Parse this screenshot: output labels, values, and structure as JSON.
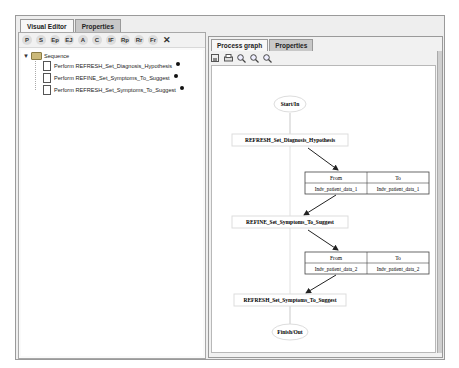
{
  "left_panel": {
    "tabs": [
      "Visual Editor",
      "Properties"
    ],
    "toolbar": [
      {
        "icon": "P",
        "name": "perform-icon"
      },
      {
        "icon": "S",
        "name": "sequence-icon"
      },
      {
        "icon": "Ep",
        "name": "ep-icon"
      },
      {
        "icon": "EJ",
        "name": "ej-icon"
      },
      {
        "icon": "A",
        "name": "a-icon"
      },
      {
        "icon": "C",
        "name": "c-icon"
      },
      {
        "icon": "IF",
        "name": "if-icon"
      },
      {
        "icon": "Rp",
        "name": "rp-icon"
      },
      {
        "icon": "Rr",
        "name": "rr-icon"
      },
      {
        "icon": "Fr",
        "name": "fr-icon"
      },
      {
        "icon": "✕",
        "name": "delete-icon"
      }
    ],
    "tree": {
      "root": "Sequence",
      "items": [
        "Perform REFRESH_Set_Diagnosis_Hypothesis",
        "Perform REFINE_Set_Symptoms_To_Suggest",
        "Perform REFRESH_Set_Symptoms_To_Suggest"
      ]
    }
  },
  "right_panel": {
    "tabs": [
      "Process graph",
      "Properties"
    ],
    "toolbar": [
      "save-icon",
      "print-icon",
      "zoom-in-icon",
      "zoom-out-icon",
      "zoom-fit-icon"
    ],
    "graph": {
      "start": "Start/In",
      "finish": "Finish/Out",
      "nodes": [
        "REFRESH_Set_Diagnosis_Hypothesis",
        "REFINE_Set_Symptoms_To_Suggest",
        "REFRESH_Set_Symptoms_To_Suggest"
      ],
      "mappings": [
        {
          "from_header": "From",
          "to_header": "To",
          "from": "Indv_patient_data_1",
          "to": "Indv_patient_data_1"
        },
        {
          "from_header": "From",
          "to_header": "To",
          "from": "Indv_patient_data_2",
          "to": "Indv_patient_data_2"
        }
      ]
    }
  }
}
